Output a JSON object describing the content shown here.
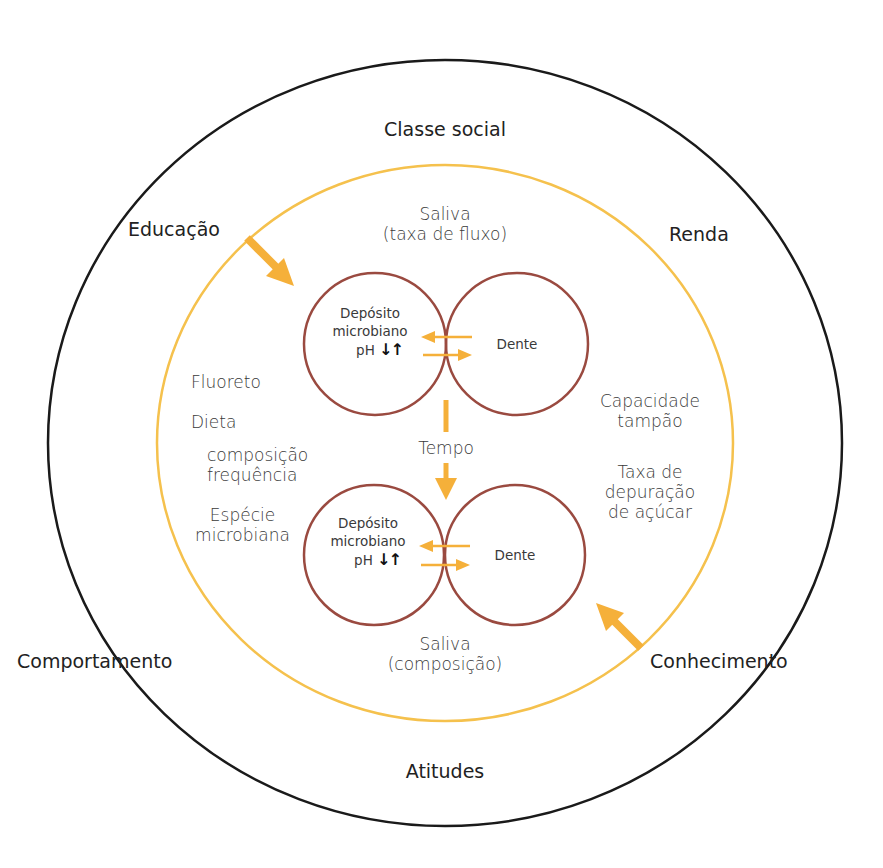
{
  "colors": {
    "outer_ring": "#1a1a1a",
    "middle_ring": "#f5c14d",
    "inner_circles": "#9a4a40",
    "arrows": "#f5b03a",
    "ph_arrows": "#111111",
    "text": "#2b2b2b"
  },
  "outer_ring": {
    "labels": {
      "top": "Classe social",
      "top_left": "Educação",
      "top_right": "Renda",
      "bottom_left": "Comportamento",
      "bottom_right": "Conhecimento",
      "bottom": "Atitudes"
    }
  },
  "middle_ring": {
    "saliva_top": {
      "line1": "Saliva",
      "line2": "(taxa de fluxo)"
    },
    "saliva_bottom": {
      "line1": "Saliva",
      "line2": "(composição)"
    },
    "left_factors": {
      "fluoreto": "Fluoreto",
      "dieta": "Dieta",
      "dieta_sub1": "composição",
      "dieta_sub2": "frequência",
      "especie1": "Espécie",
      "especie2": "microbiana"
    },
    "right_factors": {
      "capacidade1": "Capacidade",
      "capacidade2": "tampão",
      "taxa1": "Taxa de",
      "taxa2": "depuração",
      "taxa3": "de açúcar"
    },
    "time_label": "Tempo"
  },
  "inner": {
    "top_pair": {
      "left_line1": "Depósito",
      "left_line2": "microbiano",
      "ph_label": "pH",
      "ph_arrows": "↓↑",
      "right": "Dente"
    },
    "bottom_pair": {
      "left_line1": "Depósito",
      "left_line2": "microbiano",
      "ph_label": "pH",
      "ph_arrows": "↓↑",
      "right": "Dente"
    }
  }
}
